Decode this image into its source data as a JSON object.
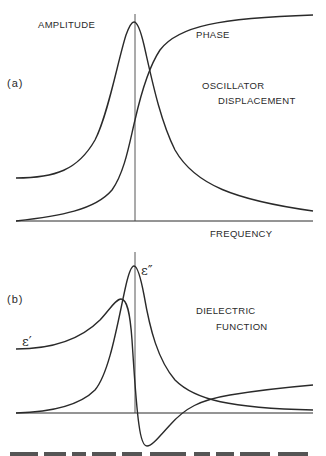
{
  "panel_a": {
    "tag": "(a)",
    "labels": {
      "amplitude": "AMPLITUDE",
      "phase": "PHASE",
      "title_line1": "OSCILLATOR",
      "title_line2": "DISPLACEMENT",
      "x_axis": "FREQUENCY"
    }
  },
  "panel_b": {
    "tag": "(b)",
    "labels": {
      "epsilon_real": "ε′",
      "epsilon_imag": "ε″",
      "title_line1": "DIELECTRIC",
      "title_line2": "FUNCTION"
    }
  },
  "colors": {
    "ink": "#2a2a2a",
    "background": "#ffffff"
  }
}
